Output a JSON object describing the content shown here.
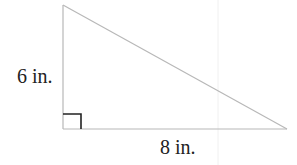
{
  "figure": {
    "type": "right-triangle",
    "vertices": {
      "top": [
        63,
        5
      ],
      "right_angle": [
        63,
        129
      ],
      "right": [
        287,
        129
      ]
    },
    "right_angle_marker": {
      "size": 18
    },
    "labels": {
      "height": "6 in.",
      "base": "8 in."
    },
    "colors": {
      "edge": "#b8b8b8",
      "marker": "#222222",
      "text": "#222222",
      "artifact": "#f0f0f0"
    }
  }
}
